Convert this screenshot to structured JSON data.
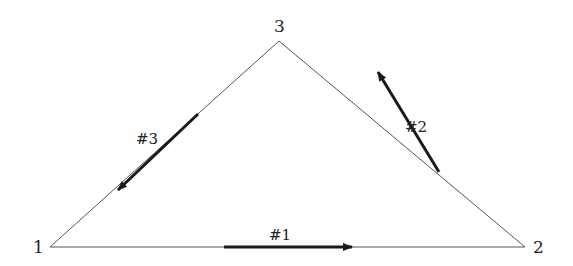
{
  "diagram": {
    "type": "triangle-network",
    "vertices": [
      {
        "id": "1",
        "label": "1",
        "x": 50,
        "y": 247
      },
      {
        "id": "2",
        "label": "2",
        "x": 525,
        "y": 247
      },
      {
        "id": "3",
        "label": "3",
        "x": 279,
        "y": 41
      }
    ],
    "edges": [
      {
        "from": "1",
        "to": "2",
        "label": "#1",
        "arrow_direction": "1→2"
      },
      {
        "from": "2",
        "to": "3",
        "label": "#2",
        "arrow_direction": "2→3"
      },
      {
        "from": "3",
        "to": "1",
        "label": "#3",
        "arrow_direction": "3→1"
      }
    ],
    "colors": {
      "line": "#444444",
      "arrow": "#1a1a1a",
      "text": "#222222"
    }
  }
}
